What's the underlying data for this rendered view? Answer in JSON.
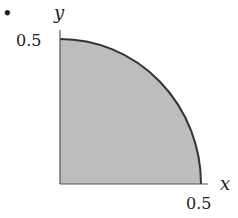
{
  "figure": {
    "bullet": "•",
    "region_fill": "#bdbdbd",
    "curve_color": "#333333",
    "axis_color": "#555555",
    "x_axis": {
      "label": "x",
      "tick_label": "0.5"
    },
    "y_axis": {
      "label": "y",
      "tick_label": "0.5"
    },
    "shape": "quarter-disk of radius 0.5 in first quadrant"
  }
}
